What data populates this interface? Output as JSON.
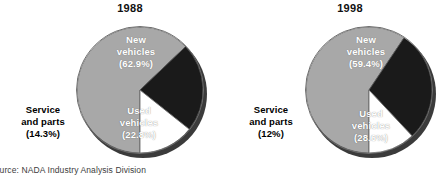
{
  "source_note": "Source: NADA Industry Analysis Division",
  "colors": {
    "new_vehicles": "#a8a8a8",
    "used_vehicles": "#1a1a1a",
    "service_and_parts": "#ffffff",
    "shadow": "#3b3b3b",
    "outline": "#6e6e6e",
    "background": "#ffffff",
    "text": "#000000"
  },
  "charts": [
    {
      "title": "1988",
      "labels": {
        "new": "New\nvehicles\n(62.9%)",
        "new_line1": "New",
        "new_line2": "vehicles",
        "new_value": "(62.9%)",
        "used_line1": "Used",
        "used_line2": "vehicles",
        "used_value": "(22.8%)",
        "service_line1": "Service",
        "service_line2": "and parts",
        "service_value": "(14.3%)"
      }
    },
    {
      "title": "1998",
      "labels": {
        "new_line1": "New",
        "new_line2": "vehicles",
        "new_value": "(59.4%)",
        "used_line1": "Used",
        "used_line2": "vehicles",
        "used_value": "(28.6%)",
        "service_line1": "Service",
        "service_line2": "and parts",
        "service_value": "(12%)"
      }
    }
  ],
  "chart_data": [
    {
      "type": "pie",
      "title": "1988",
      "categories": [
        "New vehicles",
        "Used vehicles",
        "Service and parts"
      ],
      "values": [
        62.9,
        22.8,
        14.3
      ],
      "value_labels": [
        "(62.9%)",
        "(22.8%)",
        "(14.3%)"
      ],
      "units": "percent",
      "colors": [
        "#a8a8a8",
        "#1a1a1a",
        "#ffffff"
      ],
      "start_angle_deg": 180,
      "direction": "clockwise",
      "legend": "none",
      "labels_inside": [
        "New vehicles",
        "Used vehicles"
      ],
      "labels_outside": [
        "Service and parts"
      ]
    },
    {
      "type": "pie",
      "title": "1998",
      "categories": [
        "New vehicles",
        "Used vehicles",
        "Service and parts"
      ],
      "values": [
        59.4,
        28.6,
        12.0
      ],
      "value_labels": [
        "(59.4%)",
        "(28.6%)",
        "(12%)"
      ],
      "units": "percent",
      "colors": [
        "#a8a8a8",
        "#1a1a1a",
        "#ffffff"
      ],
      "start_angle_deg": 180,
      "direction": "clockwise",
      "legend": "none",
      "labels_inside": [
        "New vehicles",
        "Used vehicles"
      ],
      "labels_outside": [
        "Service and parts"
      ]
    }
  ]
}
